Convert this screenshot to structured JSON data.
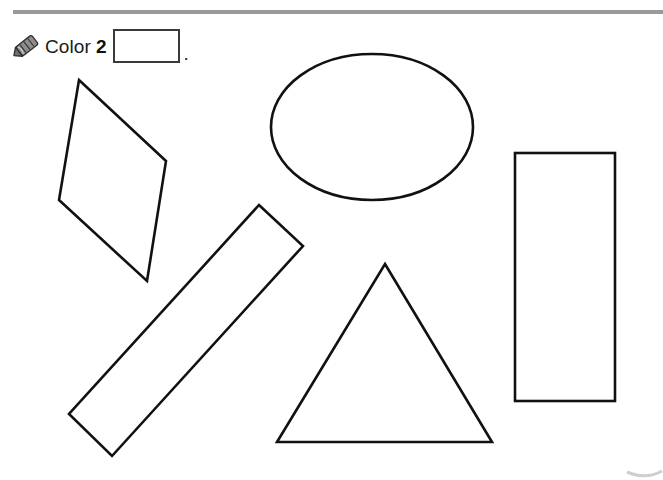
{
  "page": {
    "background_color": "#ffffff",
    "width": 663,
    "height": 480
  },
  "top_rule": {
    "color": "#9a9a9a"
  },
  "instruction": {
    "icon": "crayon-icon",
    "verb": "Color",
    "count": "2",
    "answer_box_value": "",
    "answer_box_placeholder": "",
    "period": ".",
    "full_text": "Color 2 ."
  },
  "shapes": [
    {
      "id": "quadrilateral",
      "name": "quadrilateral",
      "type": "polygon",
      "points": "79,80 166,161 147,281 59,200",
      "stroke": "#111111",
      "fill": "#ffffff"
    },
    {
      "id": "ellipse",
      "name": "ellipse",
      "type": "ellipse",
      "cx": 372,
      "cy": 127,
      "rx": 101,
      "ry": 73,
      "stroke": "#111111",
      "fill": "#ffffff"
    },
    {
      "id": "diagonal-rectangle",
      "name": "diagonal-rectangle",
      "type": "polygon",
      "points": "259,205 303,246 112,456 69,414",
      "stroke": "#111111",
      "fill": "#ffffff"
    },
    {
      "id": "triangle",
      "name": "triangle",
      "type": "polygon",
      "points": "385,264 492,442 277,442",
      "stroke": "#111111",
      "fill": "#ffffff"
    },
    {
      "id": "vertical-rectangle",
      "name": "vertical-rectangle",
      "type": "rect",
      "x": 515,
      "y": 153,
      "width": 100,
      "height": 248,
      "stroke": "#111111",
      "fill": "#ffffff"
    }
  ],
  "artifact": {
    "name": "page-corner-artifact",
    "color": "#cfcfcf"
  }
}
